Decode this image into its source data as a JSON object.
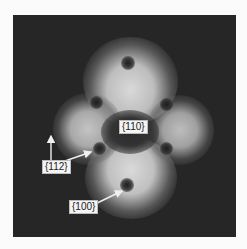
{
  "figure": {
    "type": "field emission micrograph",
    "labels": {
      "center": "{110}",
      "left": "{112}",
      "bottom": "{100}"
    },
    "colors": {
      "background": "#262626",
      "bright": "#d8d8d8",
      "label_bg": "#f4f4f4",
      "arrow": "#f0f0f0"
    }
  }
}
